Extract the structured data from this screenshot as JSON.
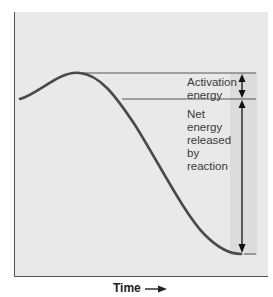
{
  "diagram": {
    "type": "energy-profile",
    "curve_color": "#4a4a4a",
    "background_color": "#e9e9e9",
    "band_color": "#dadada",
    "labels": {
      "activation": "Activation\nenergy",
      "net": "Net\nenergy\nreleased\nby\nreaction"
    },
    "x_axis": {
      "label": "Time",
      "arrow": "→"
    }
  }
}
